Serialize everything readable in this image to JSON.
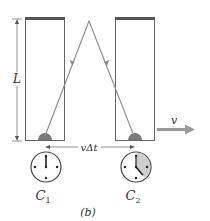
{
  "diagram": {
    "caption": "(b)",
    "length_label": "L",
    "displacement_label": "vΔt",
    "velocity_label": "v",
    "clocks": [
      {
        "label": "C",
        "subscript": "1",
        "hand_angle_deg": 0,
        "shaded_sector_deg": 0
      },
      {
        "label": "C",
        "subscript": "2",
        "hand_angle_deg": 140,
        "shaded_sector_deg": 140
      }
    ],
    "colors": {
      "box_stroke": "#555555",
      "mirror": "#555555",
      "ray": "#8a8a8a",
      "detector": "#7a7a7a",
      "arrow": "#9a9a9a",
      "clock_shade": "#cfcfcf",
      "text": "#333333"
    }
  }
}
